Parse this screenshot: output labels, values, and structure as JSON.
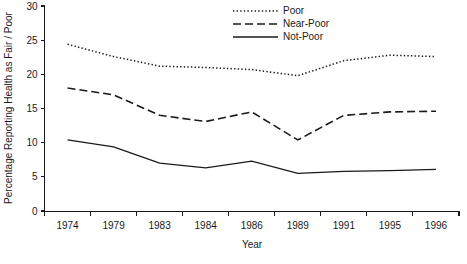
{
  "chart_data": {
    "type": "line",
    "title": "",
    "xlabel": "Year",
    "ylabel": "Percentage Reporting Health as Fair / Poor",
    "categories": [
      "1974",
      "1979",
      "1983",
      "1984",
      "1986",
      "1989",
      "1991",
      "1995",
      "1996"
    ],
    "ylim": [
      0,
      30
    ],
    "yticks": [
      0,
      5,
      10,
      15,
      20,
      25,
      30
    ],
    "ytick_labels": [
      "0",
      "5",
      "10",
      "15",
      "20",
      "25",
      "30"
    ],
    "grid": false,
    "legend_position": "top-center",
    "series": [
      {
        "name": "Poor",
        "style": "dotted",
        "color": "#1a1a1a",
        "values": [
          24.4,
          22.6,
          21.2,
          21.0,
          20.7,
          19.8,
          22.0,
          22.8,
          22.6
        ]
      },
      {
        "name": "Near-Poor",
        "style": "dashed",
        "color": "#1a1a1a",
        "values": [
          18.0,
          17.0,
          14.0,
          13.1,
          14.5,
          10.4,
          14.0,
          14.5,
          14.6
        ]
      },
      {
        "name": "Not-Poor",
        "style": "solid",
        "color": "#1a1a1a",
        "values": [
          10.4,
          9.4,
          7.0,
          6.3,
          7.3,
          5.5,
          5.8,
          5.9,
          6.1
        ]
      }
    ]
  },
  "legend": {
    "entries": [
      {
        "label": "Poor",
        "style": "dotted"
      },
      {
        "label": "Near-Poor",
        "style": "dashed"
      },
      {
        "label": "Not-Poor",
        "style": "solid"
      }
    ]
  },
  "axes": {
    "y_title": "Percentage Reporting Health as Fair / Poor",
    "x_title": "Year"
  }
}
